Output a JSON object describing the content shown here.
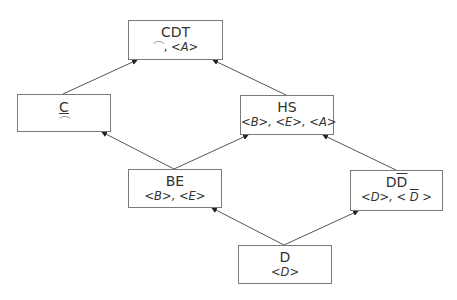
{
  "diagram": {
    "type": "lattice",
    "nodes": [
      {
        "id": "CDT",
        "title": "CDT",
        "sub": "⌒, <A>",
        "sub_parts": [
          "⌒",
          ", ",
          "<A>"
        ]
      },
      {
        "id": "C",
        "title": "C",
        "sub": "⌒",
        "title_underlined": true
      },
      {
        "id": "HS",
        "title": "HS",
        "sub": "<B>, <E>, <A>"
      },
      {
        "id": "BE",
        "title": "BE",
        "sub": "<B>, <E>"
      },
      {
        "id": "DDbar",
        "title_plain": "D",
        "title_overline": "D",
        "sub_a": "<D>, ",
        "sub_b_left": "< ",
        "sub_b_over": "D",
        "sub_b_right": " >"
      },
      {
        "id": "D",
        "title": "D",
        "sub": "<D>"
      }
    ],
    "edges": [
      {
        "from": "D",
        "to": "BE"
      },
      {
        "from": "D",
        "to": "DDbar"
      },
      {
        "from": "BE",
        "to": "C"
      },
      {
        "from": "BE",
        "to": "HS"
      },
      {
        "from": "DDbar",
        "to": "HS"
      },
      {
        "from": "C",
        "to": "CDT"
      },
      {
        "from": "HS",
        "to": "CDT"
      }
    ],
    "colors": {
      "border": "#7a7a7a",
      "edge": "#444444",
      "text": "#333333"
    }
  }
}
